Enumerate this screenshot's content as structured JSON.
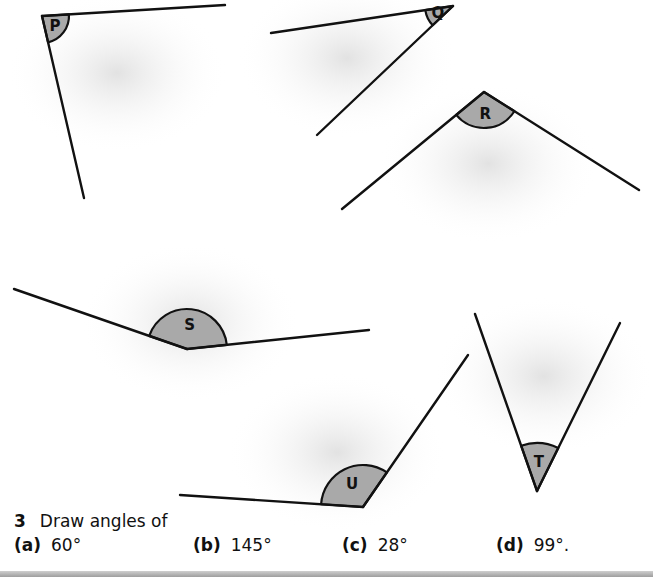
{
  "angles": [
    {
      "label": "P",
      "vertex": [
        42,
        16
      ],
      "rays": [
        [
          225,
          5
        ],
        [
          84,
          198
        ]
      ],
      "arc_radius": 27,
      "type": "acute"
    },
    {
      "label": "Q",
      "vertex": [
        453,
        6
      ],
      "rays": [
        [
          271,
          33
        ],
        [
          317,
          135
        ]
      ],
      "arc_radius": 28,
      "type": "acute"
    },
    {
      "label": "R",
      "vertex": [
        484,
        92
      ],
      "rays": [
        [
          342,
          209
        ],
        [
          639,
          190
        ]
      ],
      "arc_radius": 36,
      "type": "obtuse"
    },
    {
      "label": "S",
      "vertex": [
        187,
        349
      ],
      "rays": [
        [
          14,
          289
        ],
        [
          369,
          330
        ]
      ],
      "arc_radius": 40,
      "type": "obtuse"
    },
    {
      "label": "U",
      "vertex": [
        363,
        507
      ],
      "rays": [
        [
          180,
          495
        ],
        [
          468,
          355
        ]
      ],
      "arc_radius": 42,
      "type": "obtuse"
    },
    {
      "label": "T",
      "vertex": [
        537,
        491
      ],
      "rays": [
        [
          475,
          314
        ],
        [
          620,
          323
        ]
      ],
      "arc_radius": 48,
      "type": "acute"
    }
  ],
  "colors": {
    "arc_fill": "#a9a9a9",
    "line": "#111111",
    "shading": "#e6e6e6"
  },
  "exercise": {
    "number": "3",
    "instruction": "Draw angles of",
    "parts": [
      {
        "label": "(a)",
        "value": "60°"
      },
      {
        "label": "(b)",
        "value": "145°"
      },
      {
        "label": "(c)",
        "value": "28°"
      },
      {
        "label": "(d)",
        "value": "99°."
      }
    ]
  }
}
